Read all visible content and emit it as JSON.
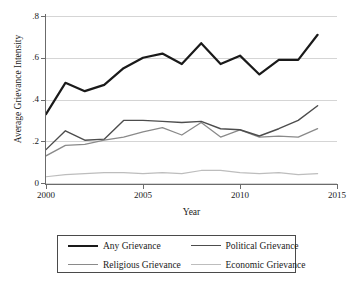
{
  "chart_data": {
    "type": "line",
    "title": "",
    "xlabel": "Year",
    "ylabel": "Average Grievance Intensity",
    "xlim": [
      2000,
      2015
    ],
    "ylim": [
      0,
      0.8
    ],
    "grid": true,
    "legend_position": "below",
    "x_ticks": [
      "2000",
      "2005",
      "2010",
      "2015"
    ],
    "x_tick_values": [
      2000,
      2005,
      2010,
      2015
    ],
    "y_ticks": [
      "0",
      ".2",
      ".4",
      ".6",
      ".8"
    ],
    "y_tick_values": [
      0,
      0.2,
      0.4,
      0.6,
      0.8
    ],
    "x": [
      2000,
      2001,
      2002,
      2003,
      2004,
      2005,
      2006,
      2007,
      2008,
      2009,
      2010,
      2011,
      2012,
      2013,
      2014
    ],
    "series": [
      {
        "name": "Any Grievance",
        "color": "#1a1a1a",
        "width": 2.2,
        "values": [
          0.33,
          0.48,
          0.44,
          0.47,
          0.55,
          0.6,
          0.62,
          0.57,
          0.67,
          0.57,
          0.61,
          0.52,
          0.59,
          0.59,
          0.71
        ]
      },
      {
        "name": "Political Grievance",
        "color": "#4d4d4d",
        "width": 1.4,
        "values": [
          0.16,
          0.25,
          0.205,
          0.21,
          0.3,
          0.3,
          0.295,
          0.29,
          0.295,
          0.26,
          0.255,
          0.225,
          0.26,
          0.3,
          0.37
        ]
      },
      {
        "name": "Religious Grievance",
        "color": "#8a8a8a",
        "width": 1.3,
        "values": [
          0.13,
          0.18,
          0.185,
          0.205,
          0.22,
          0.245,
          0.265,
          0.23,
          0.29,
          0.22,
          0.255,
          0.22,
          0.225,
          0.22,
          0.26
        ]
      },
      {
        "name": "Economic Grievance",
        "color": "#bdbdbd",
        "width": 1.2,
        "values": [
          0.03,
          0.04,
          0.045,
          0.05,
          0.05,
          0.045,
          0.05,
          0.045,
          0.06,
          0.06,
          0.05,
          0.045,
          0.05,
          0.04,
          0.045
        ]
      }
    ]
  },
  "legend": {
    "entries": [
      {
        "label": "Any Grievance"
      },
      {
        "label": "Political Grievance"
      },
      {
        "label": "Religious Grievance"
      },
      {
        "label": "Economic Grievance"
      }
    ]
  }
}
